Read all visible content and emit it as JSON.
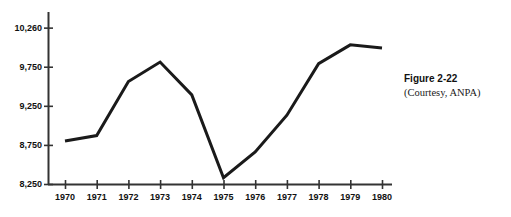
{
  "figure": {
    "caption_title": "Figure 2-22",
    "caption_credit": "(Courtesy, ANPA)"
  },
  "chart_data": {
    "type": "line",
    "title": "",
    "subtitle": "",
    "xlabel": "",
    "ylabel": "",
    "categories": [
      "1970",
      "1971",
      "1972",
      "1973",
      "1974",
      "1975",
      "1976",
      "1977",
      "1978",
      "1979",
      "1980"
    ],
    "x": [
      1970,
      1971,
      1972,
      1973,
      1974,
      1975,
      1976,
      1977,
      1978,
      1979,
      1980
    ],
    "values": [
      8800,
      8870,
      9560,
      9810,
      9390,
      8330,
      8660,
      9130,
      9790,
      10030,
      9990
    ],
    "series": [
      {
        "name": "",
        "values": [
          8800,
          8870,
          9560,
          9810,
          9390,
          8330,
          8660,
          9130,
          9790,
          10030,
          9990
        ]
      }
    ],
    "ylim": [
      8250,
      10450
    ],
    "xlim": [
      1970,
      1980
    ],
    "yticks": [
      8250,
      8750,
      9250,
      9750,
      10250
    ],
    "ytick_labels": [
      "8,250",
      "8,750",
      "9,250",
      "9,750",
      "10,260"
    ],
    "xticks": [
      1970,
      1971,
      1972,
      1973,
      1974,
      1975,
      1976,
      1977,
      1978,
      1979,
      1980
    ],
    "xtick_labels": [
      "1970",
      "1971",
      "1972",
      "1973",
      "1974",
      "1975",
      "1976",
      "1977",
      "1978",
      "1979",
      "1980"
    ],
    "grid": false,
    "legend": false,
    "legend_position": "none",
    "line_color": "#1a1a1a",
    "axis_color": "#333333",
    "background_color": "#ffffff",
    "annotations": []
  }
}
